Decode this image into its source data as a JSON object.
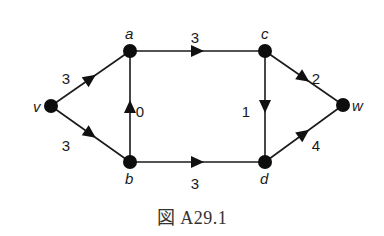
{
  "figure": {
    "caption": "図 A29.1"
  },
  "graph": {
    "nodes": [
      {
        "id": "v",
        "label": "v",
        "x": 51,
        "y": 106,
        "lx": 33,
        "ly": 112
      },
      {
        "id": "a",
        "label": "a",
        "x": 130,
        "y": 51,
        "lx": 125,
        "ly": 39
      },
      {
        "id": "b",
        "label": "b",
        "x": 130,
        "y": 162,
        "lx": 125,
        "ly": 184
      },
      {
        "id": "c",
        "label": "c",
        "x": 265,
        "y": 51,
        "lx": 261,
        "ly": 39
      },
      {
        "id": "d",
        "label": "d",
        "x": 265,
        "y": 162,
        "lx": 260,
        "ly": 184
      },
      {
        "id": "w",
        "label": "w",
        "x": 343,
        "y": 105,
        "lx": 352,
        "ly": 111
      }
    ],
    "edges": [
      {
        "from": "v",
        "to": "a",
        "weight": "3",
        "wx": 66,
        "wy": 79
      },
      {
        "from": "v",
        "to": "b",
        "weight": "3",
        "wx": 66,
        "wy": 146
      },
      {
        "from": "b",
        "to": "a",
        "weight": "0",
        "wx": 140,
        "wy": 112
      },
      {
        "from": "a",
        "to": "c",
        "weight": "3",
        "wx": 195,
        "wy": 38
      },
      {
        "from": "b",
        "to": "d",
        "weight": "3",
        "wx": 195,
        "wy": 184
      },
      {
        "from": "c",
        "to": "d",
        "weight": "1",
        "wx": 246,
        "wy": 112
      },
      {
        "from": "c",
        "to": "w",
        "weight": "2",
        "wx": 316,
        "wy": 79
      },
      {
        "from": "d",
        "to": "w",
        "weight": "4",
        "wx": 316,
        "wy": 146
      }
    ]
  },
  "colors": {
    "node": "#0d0d0d",
    "edge": "#1a1a1a",
    "background": "#ffffff"
  }
}
